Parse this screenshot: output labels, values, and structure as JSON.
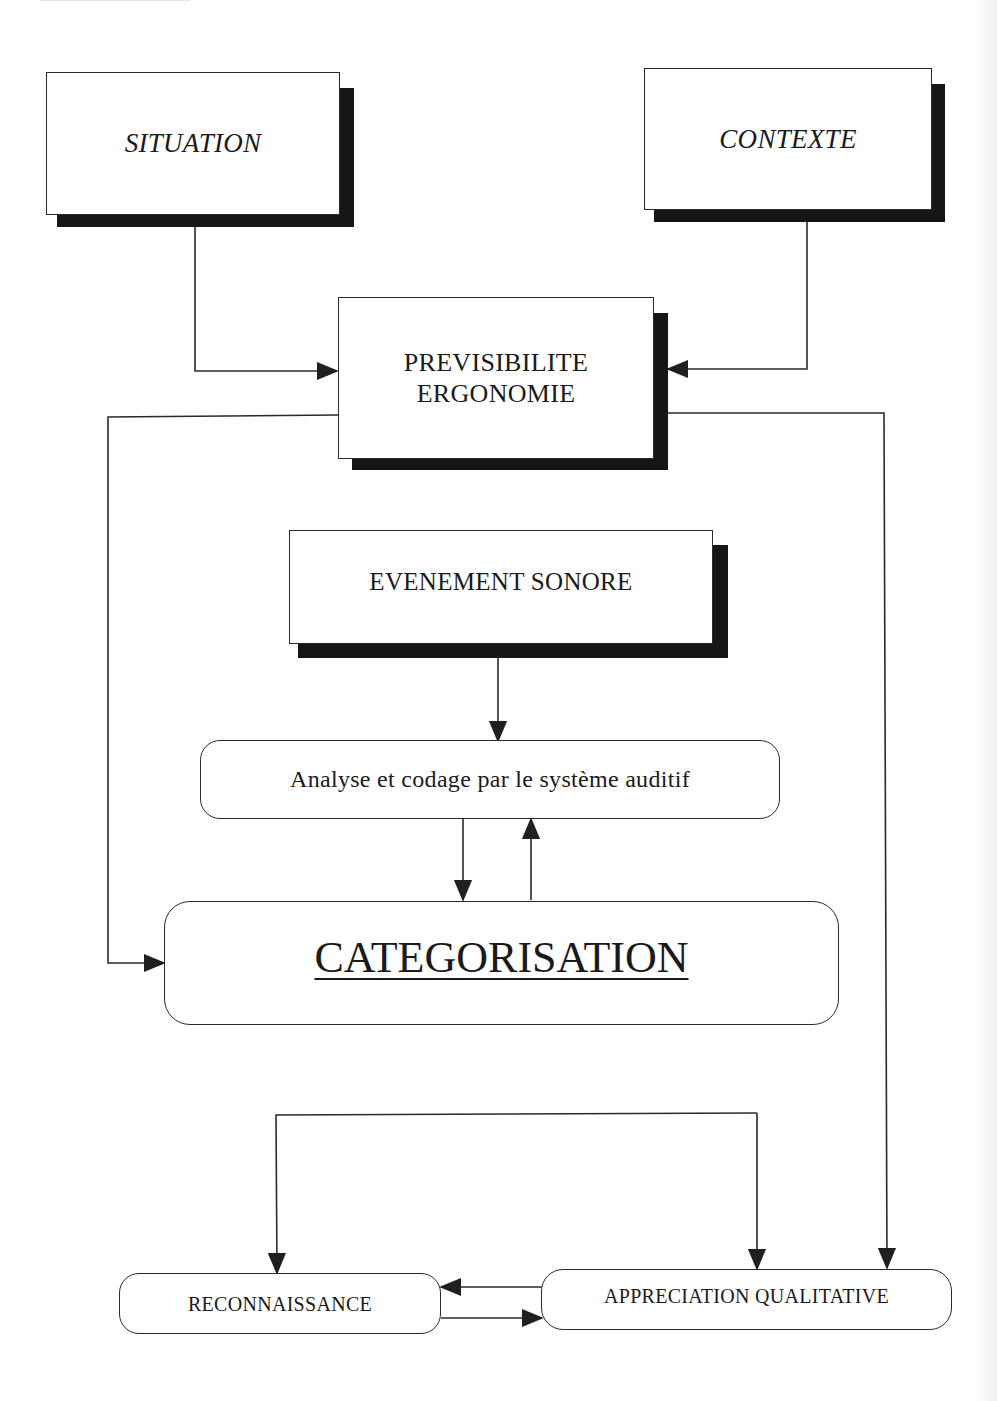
{
  "diagram": {
    "type": "flowchart",
    "colors": {
      "line": "#2a2a2a",
      "shadow": "#161616",
      "box_fill": "#ffffff",
      "background": "#ffffff"
    },
    "nodes": {
      "situation": {
        "label": "SITUATION",
        "style": "italic, shadowed rectangle"
      },
      "contexte": {
        "label": "CONTEXTE",
        "style": "italic, shadowed rectangle"
      },
      "previsibilite": {
        "label_line1": "PREVISIBILITE",
        "label_line2": "ERGONOMIE",
        "style": "shadowed rectangle"
      },
      "evenement": {
        "label": "EVENEMENT SONORE",
        "style": "shadowed rectangle"
      },
      "analyse": {
        "label": "Analyse et codage par le système auditif",
        "style": "rounded rectangle"
      },
      "categorisation": {
        "label": "CATEGORISATION",
        "style": "rounded rectangle, underlined"
      },
      "reconnaissance": {
        "label": "RECONNAISSANCE",
        "style": "rounded rectangle"
      },
      "appreciation": {
        "label": "APPRECIATION QUALITATIVE",
        "style": "rounded rectangle"
      }
    },
    "edges": [
      {
        "from": "SITUATION",
        "to": "PREVISIBILITE ERGONOMIE"
      },
      {
        "from": "CONTEXTE",
        "to": "PREVISIBILITE ERGONOMIE"
      },
      {
        "from": "PREVISIBILITE ERGONOMIE",
        "to": "CATEGORISATION"
      },
      {
        "from": "PREVISIBILITE ERGONOMIE",
        "to": "APPRECIATION QUALITATIVE"
      },
      {
        "from": "EVENEMENT SONORE",
        "to": "Analyse et codage par le système auditif"
      },
      {
        "from": "Analyse et codage par le système auditif",
        "to": "CATEGORISATION"
      },
      {
        "from": "CATEGORISATION",
        "to": "Analyse et codage par le système auditif"
      },
      {
        "from": "Junction",
        "to": "RECONNAISSANCE"
      },
      {
        "from": "Junction",
        "to": "APPRECIATION QUALITATIVE"
      },
      {
        "from": "APPRECIATION QUALITATIVE",
        "to": "RECONNAISSANCE"
      },
      {
        "from": "RECONNAISSANCE",
        "to": "APPRECIATION QUALITATIVE"
      }
    ]
  }
}
